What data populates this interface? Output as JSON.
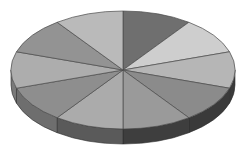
{
  "chart_data": {
    "type": "pie",
    "variant": "3d",
    "title": "",
    "categories": [
      "1",
      "2",
      "3",
      "4",
      "5",
      "6",
      "7",
      "8",
      "9",
      "10"
    ],
    "values": [
      10,
      10,
      10,
      10,
      10,
      10,
      10,
      10,
      10,
      10
    ],
    "colors": [
      "#6f6f6f",
      "#cecece",
      "#b6b6b6",
      "#8b8b8b",
      "#9a9a9a",
      "#ababab",
      "#8e8e8e",
      "#adadad",
      "#939393",
      "#bababa"
    ],
    "side_colors": [
      "#3c3c3c",
      "#4a4a4a",
      "#3a3a3a",
      "#3a3a3a",
      "#3e3e3e",
      "#5a5a5a",
      "#6e6e6e",
      "#7a7a7a",
      "#757575",
      "#777777"
    ],
    "start_angle_deg": -90,
    "legend": "none",
    "labels_shown": false
  },
  "geometry": {
    "cx": 123,
    "cy": 70,
    "rx": 112,
    "ry": 59,
    "depth": 15
  }
}
